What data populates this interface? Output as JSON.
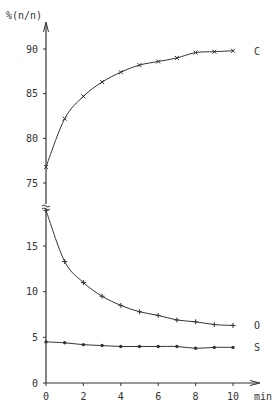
{
  "chart_data": {
    "type": "line",
    "title": "",
    "ylabel": "%(n/n)",
    "xlabel": "min",
    "x": [
      0,
      1,
      2,
      3,
      4,
      5,
      6,
      7,
      8,
      9,
      10
    ],
    "xticks": [
      "0",
      "2",
      "4",
      "6",
      "8",
      "10"
    ],
    "yticks_upper": [
      "75",
      "80",
      "85",
      "90"
    ],
    "yticks_lower": [
      "0",
      "5",
      "10",
      "15"
    ],
    "axis_break": "between 19 and 75",
    "grid": false,
    "series": [
      {
        "name": "C",
        "marker": "x",
        "values": [
          76.8,
          82.2,
          84.7,
          86.3,
          87.4,
          88.2,
          88.6,
          89.0,
          89.6,
          89.7,
          89.8
        ]
      },
      {
        "name": "O",
        "marker": "+",
        "values": [
          18.9,
          13.3,
          11.0,
          9.5,
          8.5,
          7.8,
          7.4,
          6.9,
          6.7,
          6.4,
          6.3
        ]
      },
      {
        "name": "S",
        "marker": "dot",
        "values": [
          4.5,
          4.4,
          4.2,
          4.1,
          4.0,
          4.0,
          4.0,
          4.0,
          3.8,
          3.9,
          3.9
        ]
      }
    ],
    "ylim_upper": [
      75,
      92
    ],
    "ylim_lower": [
      0,
      19
    ],
    "xlim": [
      0,
      10
    ]
  }
}
